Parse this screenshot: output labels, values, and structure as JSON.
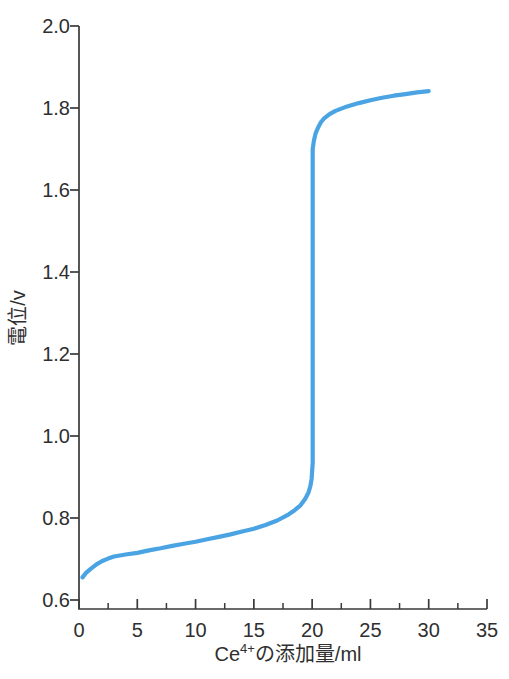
{
  "chart_data": {
    "type": "line",
    "title": "",
    "xlabel": "Ce⁴⁺の添加量/ml",
    "xlabel_parts": {
      "base": "Ce",
      "superscript": "4+",
      "rest": "の添加量/ml"
    },
    "ylabel": "電位/v",
    "xlim": [
      0,
      35
    ],
    "ylim": [
      0.6,
      2.0
    ],
    "x_major_ticks": [
      0,
      5,
      10,
      15,
      20,
      25,
      30,
      35
    ],
    "x_tick_labels": [
      "0",
      "5",
      "10",
      "15",
      "20",
      "25",
      "30",
      "35"
    ],
    "x_minor_ticks": [
      2.5,
      7.5,
      12.5,
      17.5,
      22.5,
      27.5,
      32.5
    ],
    "y_major_ticks": [
      0.6,
      0.8,
      1.0,
      1.2,
      1.4,
      1.6,
      1.8,
      2.0
    ],
    "y_tick_labels": [
      "0.6",
      "0.8",
      "1.0",
      "1.2",
      "1.4",
      "1.6",
      "1.8",
      "2.0"
    ],
    "grid": false,
    "legend": false,
    "colors": {
      "curve": "#4aa3e3",
      "axis": "#3a3a3a",
      "text": "#2f2f2f",
      "background": "#ffffff"
    },
    "line_width": 4.2,
    "series": [
      {
        "name": "titration curve",
        "points": [
          [
            0.3,
            0.655
          ],
          [
            0.6,
            0.666
          ],
          [
            1,
            0.676
          ],
          [
            1.5,
            0.687
          ],
          [
            2,
            0.695
          ],
          [
            2.5,
            0.701
          ],
          [
            3,
            0.706
          ],
          [
            4,
            0.711
          ],
          [
            5,
            0.715
          ],
          [
            6,
            0.721
          ],
          [
            7,
            0.726
          ],
          [
            8,
            0.732
          ],
          [
            9,
            0.737
          ],
          [
            10,
            0.742
          ],
          [
            11,
            0.748
          ],
          [
            12,
            0.754
          ],
          [
            13,
            0.76
          ],
          [
            14,
            0.767
          ],
          [
            15,
            0.774
          ],
          [
            16,
            0.783
          ],
          [
            17,
            0.794
          ],
          [
            18,
            0.809
          ],
          [
            18.5,
            0.819
          ],
          [
            19,
            0.831
          ],
          [
            19.4,
            0.846
          ],
          [
            19.7,
            0.863
          ],
          [
            19.85,
            0.878
          ],
          [
            19.95,
            0.895
          ],
          [
            20.05,
            0.935
          ],
          [
            20.05,
            1.7
          ],
          [
            20.15,
            1.72
          ],
          [
            20.3,
            1.738
          ],
          [
            20.5,
            1.752
          ],
          [
            20.75,
            1.765
          ],
          [
            21,
            1.774
          ],
          [
            21.5,
            1.785
          ],
          [
            22,
            1.793
          ],
          [
            23,
            1.804
          ],
          [
            24,
            1.812
          ],
          [
            25,
            1.819
          ],
          [
            26,
            1.825
          ],
          [
            27,
            1.83
          ],
          [
            28,
            1.834
          ],
          [
            29,
            1.838
          ],
          [
            30,
            1.841
          ]
        ]
      }
    ]
  }
}
